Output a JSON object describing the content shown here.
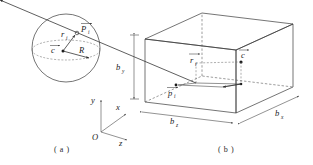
{
  "figure": {
    "panels": [
      {
        "id": "panel-a",
        "caption": "( a )",
        "kind": "sphere",
        "labels": {
          "center_vector": "c",
          "radius": "R",
          "point_vector": "r",
          "point_vector_sub": "i",
          "point": "P",
          "point_sub": "i"
        }
      },
      {
        "id": "panel-b",
        "caption": "( b )",
        "kind": "bounding-box",
        "labels": {
          "dim_height": "b",
          "dim_height_sub": "y",
          "dim_front": "b",
          "dim_front_sub": "z",
          "dim_side": "b",
          "dim_side_sub": "x",
          "center_vector": "c",
          "point_vector": "r",
          "point_vector_sub": "i",
          "point": "p",
          "point_sub": "i"
        }
      }
    ],
    "axes": {
      "origin": "O",
      "x": "x",
      "y": "y",
      "z": "z"
    },
    "colors": {
      "stroke": "#3a3a3a",
      "dashed": "#5a5a5a",
      "text": "#1a1a1a",
      "background": "#ffffff"
    }
  }
}
